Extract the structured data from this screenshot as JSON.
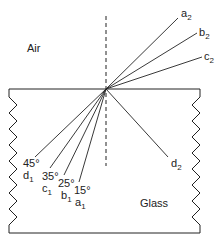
{
  "diagram": {
    "media": {
      "upper": "Air",
      "lower": "Glass"
    },
    "normal": {
      "style": "dashed"
    },
    "incident_rays": [
      {
        "id": "a1",
        "label": "a",
        "sub": "1",
        "angle": "15°"
      },
      {
        "id": "b1",
        "label": "b",
        "sub": "1",
        "angle": "25°"
      },
      {
        "id": "c1",
        "label": "c",
        "sub": "1",
        "angle": "35°"
      },
      {
        "id": "d1",
        "label": "d",
        "sub": "1",
        "angle": "45°"
      }
    ],
    "refracted_rays": [
      {
        "id": "a2",
        "label": "a",
        "sub": "2"
      },
      {
        "id": "b2",
        "label": "b",
        "sub": "2"
      },
      {
        "id": "c2",
        "label": "c",
        "sub": "2"
      }
    ],
    "reflected_rays": [
      {
        "id": "d2",
        "label": "d",
        "sub": "2"
      }
    ],
    "colors": {
      "line": "#222222",
      "background": "#ffffff"
    }
  }
}
